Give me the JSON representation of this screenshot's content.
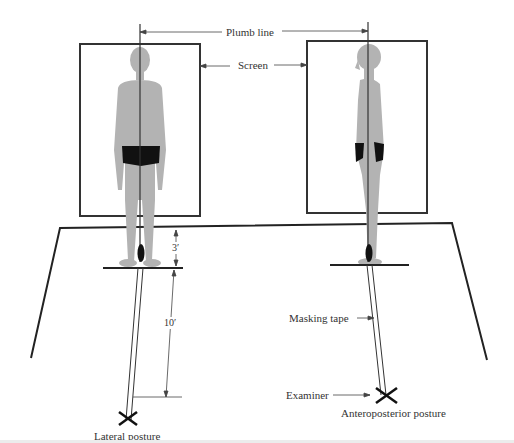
{
  "diagram": {
    "labels": {
      "plumb_line": "Plumb line",
      "screen": "Screen",
      "three_feet": "3′",
      "ten_feet": "10′",
      "masking_tape": "Masking tape",
      "examiner": "Examiner",
      "lateral_posture": "Lateral posture",
      "anteroposterior_posture": "Anteroposterior posture"
    },
    "colors": {
      "figure": "#b3b3b3",
      "shorts": "#111111",
      "lines": "#222222",
      "background": "#ffffff"
    }
  }
}
